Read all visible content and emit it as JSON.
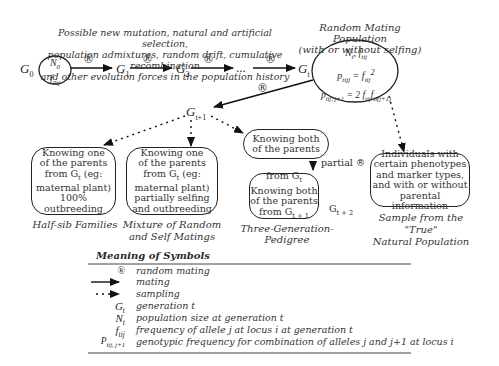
{
  "top_caption": {
    "line1": "Possible new mutation, natural and artificial selection,",
    "line2": "population admixtures, random drift, cumulative recombination",
    "line3": "and other evolution forces in the population history"
  },
  "random_mating_population": {
    "title_line1": "Random Mating Population",
    "title_line2": "(with or without selfing)",
    "eq1": "N_t, f_tij",
    "eq2": "p_tijj = f_tij^2",
    "eq3": "p_tij,j+1 = 2 f_tij f_ti(j+1)"
  },
  "nodes": {
    "g0": "G0",
    "n0": "N0",
    "f0ij": "f0ij",
    "g1": "G1",
    "g2": "G2",
    "ellipsis": "...",
    "gt": "Gt",
    "gt1": "Gt+1",
    "gt2": "Gt+2"
  },
  "random_mating_symbol": "®",
  "boxes": {
    "half_sib": {
      "lines": [
        "Knowing one",
        "of the parents",
        "from G_t (eg:",
        "maternal plant)",
        "100%",
        "outbreeding"
      ],
      "caption": "Half-sib Families"
    },
    "mixture": {
      "lines": [
        "Knowing one",
        "of the parents",
        "from G_t (eg:",
        "maternal plant)",
        "partially selfing",
        "and outbreeding"
      ],
      "caption_line1": "Mixture of Random",
      "caption_line2": "and Self Matings"
    },
    "both_parents": {
      "lines": [
        "Knowing both",
        "of the parents"
      ]
    },
    "three_gen": {
      "lines": [
        "from G_t",
        "Knowing both",
        "of the parents",
        "from G_t+1"
      ],
      "caption": "Three-Generation-Pedigree",
      "partial_label": "partial ®"
    },
    "natural": {
      "lines": [
        "Individuals with",
        "certain phenotypes",
        "and marker types,",
        "and with or without",
        "parental information"
      ],
      "caption_line1": "Sample from the \"True\"",
      "caption_line2": "Natural Population"
    }
  },
  "legend": {
    "title": "Meaning of Symbols",
    "rows": [
      {
        "symbol": "®",
        "meaning": "random mating"
      },
      {
        "symbol": "solid-arrow",
        "meaning": "mating"
      },
      {
        "symbol": "dotted-arrow",
        "meaning": "sampling"
      },
      {
        "symbol": "G_t",
        "meaning": "generation t"
      },
      {
        "symbol": "N_t",
        "meaning": "population size at generation t"
      },
      {
        "symbol": "f_tij",
        "meaning": "frequency of allele j at locus i at generation t"
      },
      {
        "symbol": "P_tij,j+1",
        "meaning": "genotypic frequency for combination of alleles j and j+1 at locus i"
      }
    ]
  }
}
